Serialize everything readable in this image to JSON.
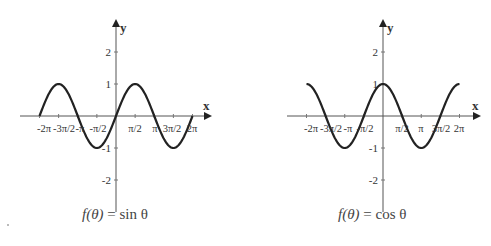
{
  "chart_data": [
    {
      "type": "line",
      "title": "f(θ) = sin θ",
      "function": "sin",
      "xlabel": "x",
      "ylabel": "y",
      "x_ticks": [
        "-2π",
        "-3π/2",
        "-π",
        "-π/2",
        "π/2",
        "π",
        "3π/2",
        "2π"
      ],
      "x_tick_values": [
        -6.2832,
        -4.7124,
        -3.1416,
        -1.5708,
        1.5708,
        3.1416,
        4.7124,
        6.2832
      ],
      "y_ticks": [
        "2",
        "1",
        "-1",
        "-2"
      ],
      "y_tick_values": [
        2,
        1,
        -1,
        -2
      ],
      "xlim": [
        -6.2832,
        6.2832
      ],
      "ylim": [
        -3,
        3
      ],
      "grid": false,
      "series": [
        {
          "name": "sin θ",
          "x": [
            -6.2832,
            -4.7124,
            -3.1416,
            -1.5708,
            0,
            1.5708,
            3.1416,
            4.7124,
            6.2832
          ],
          "values": [
            0,
            1,
            0,
            -1,
            0,
            1,
            0,
            -1,
            0
          ]
        }
      ]
    },
    {
      "type": "line",
      "title": "f(θ) = cos θ",
      "function": "cos",
      "xlabel": "x",
      "ylabel": "y",
      "x_ticks": [
        "-2π",
        "-3π/2",
        "-π",
        "-π/2",
        "π/2",
        "π",
        "3π/2",
        "2π"
      ],
      "x_tick_values": [
        -6.2832,
        -4.7124,
        -3.1416,
        -1.5708,
        1.5708,
        3.1416,
        4.7124,
        6.2832
      ],
      "y_ticks": [
        "2",
        "1",
        "-1",
        "-2"
      ],
      "y_tick_values": [
        2,
        1,
        -1,
        -2
      ],
      "xlim": [
        -6.2832,
        6.2832
      ],
      "ylim": [
        -3,
        3
      ],
      "grid": false,
      "series": [
        {
          "name": "cos θ",
          "x": [
            -6.2832,
            -4.7124,
            -3.1416,
            -1.5708,
            0,
            1.5708,
            3.1416,
            4.7124,
            6.2832
          ],
          "values": [
            1,
            0,
            -1,
            0,
            1,
            0,
            -1,
            0,
            1
          ]
        }
      ]
    }
  ],
  "plots": {
    "left": {
      "caption_lhs": "f(θ)",
      "caption_eq": "=",
      "caption_rhs": "sin θ",
      "x_axis_label": "x",
      "y_axis_label": "y"
    },
    "right": {
      "caption_lhs": "f(θ)",
      "caption_eq": "=",
      "caption_rhs": "cos θ",
      "x_axis_label": "x",
      "y_axis_label": "y"
    }
  },
  "colors": {
    "curve": "#222222",
    "axis": "#555555",
    "text": "#333333"
  }
}
